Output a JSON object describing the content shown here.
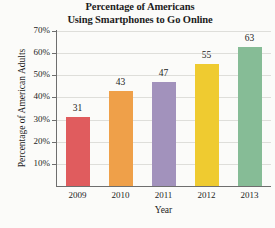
{
  "chart_data": {
    "type": "bar",
    "title": "Percentage of Americans Using Smartphones to Go Online",
    "title_lines": [
      "Percentage of Americans",
      "Using Smartphones to Go Online"
    ],
    "xlabel": "Year",
    "ylabel": "Percentage of American Adults",
    "categories": [
      "2009",
      "2010",
      "2011",
      "2012",
      "2013"
    ],
    "values": [
      31,
      43,
      47,
      55,
      63
    ],
    "value_labels": [
      "31",
      "43",
      "47",
      "55",
      "63"
    ],
    "bar_colors": [
      "#e05c5e",
      "#efa049",
      "#a292bc",
      "#efcb30",
      "#86bc96"
    ],
    "ylim": [
      0,
      70
    ],
    "ytick_values": [
      70,
      60,
      50,
      40,
      30,
      20,
      10
    ],
    "ytick_labels": [
      "70%",
      "60%",
      "50%",
      "40%",
      "30%",
      "20%",
      "10%"
    ],
    "grid": "horizontal",
    "legend": "none",
    "background_color": "#fbfbf9",
    "gridline_color": "#dededa",
    "axis_color": "#6e6e6e"
  }
}
